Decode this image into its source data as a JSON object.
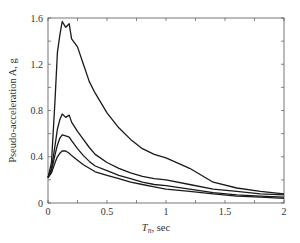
{
  "chart_data": {
    "type": "line",
    "title": "",
    "xlabel": "T_n, sec",
    "xlabel_main": "T",
    "xlabel_sub": "n",
    "xlabel_unit": ", sec",
    "ylabel": "Pseudo-acceleration A, g",
    "xlim": [
      0,
      2
    ],
    "ylim": [
      0,
      1.6
    ],
    "xticks": [
      0,
      0.5,
      1,
      1.5,
      2
    ],
    "xtick_labels": [
      "0",
      "0.5",
      "1",
      "1.5",
      "2"
    ],
    "yticks": [
      0,
      0.4,
      0.8,
      1.2,
      1.6
    ],
    "ytick_labels": [
      "0",
      "0.4",
      "0.8",
      "1.2",
      "1.6"
    ],
    "grid": false,
    "legend": null,
    "x": [
      0,
      0.03,
      0.06,
      0.08,
      0.1,
      0.12,
      0.15,
      0.18,
      0.2,
      0.25,
      0.3,
      0.35,
      0.4,
      0.5,
      0.6,
      0.7,
      0.8,
      0.9,
      1.0,
      1.2,
      1.4,
      1.6,
      1.8,
      2.0
    ],
    "series": [
      {
        "name": "curve-1",
        "values": [
          0.22,
          0.35,
          0.9,
          1.3,
          1.45,
          1.57,
          1.52,
          1.55,
          1.42,
          1.35,
          1.2,
          1.05,
          0.95,
          0.78,
          0.65,
          0.55,
          0.47,
          0.42,
          0.39,
          0.3,
          0.18,
          0.13,
          0.1,
          0.08
        ]
      },
      {
        "name": "curve-2",
        "values": [
          0.22,
          0.3,
          0.5,
          0.64,
          0.72,
          0.77,
          0.74,
          0.76,
          0.7,
          0.62,
          0.55,
          0.48,
          0.42,
          0.35,
          0.3,
          0.26,
          0.23,
          0.21,
          0.2,
          0.16,
          0.12,
          0.1,
          0.08,
          0.07
        ]
      },
      {
        "name": "curve-3",
        "values": [
          0.22,
          0.28,
          0.42,
          0.5,
          0.56,
          0.59,
          0.58,
          0.57,
          0.54,
          0.47,
          0.41,
          0.36,
          0.32,
          0.28,
          0.24,
          0.21,
          0.18,
          0.16,
          0.15,
          0.12,
          0.09,
          0.07,
          0.06,
          0.05
        ]
      },
      {
        "name": "curve-4",
        "values": [
          0.22,
          0.26,
          0.35,
          0.4,
          0.43,
          0.45,
          0.45,
          0.43,
          0.41,
          0.37,
          0.33,
          0.3,
          0.27,
          0.24,
          0.21,
          0.18,
          0.16,
          0.14,
          0.12,
          0.1,
          0.08,
          0.06,
          0.05,
          0.04
        ]
      }
    ],
    "line_color": "#1a1a1a"
  }
}
